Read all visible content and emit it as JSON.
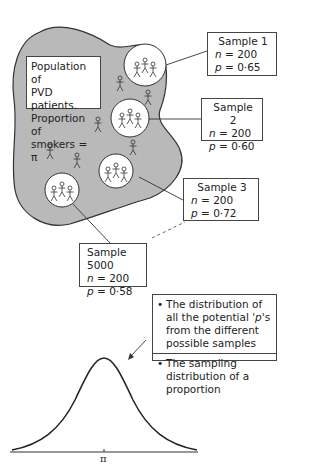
{
  "population": {
    "lines": [
      "Population of",
      "PVD patients.",
      "Proportion of",
      "smokers = π"
    ]
  },
  "samples": [
    {
      "title": "Sample 1",
      "n_label": "n",
      "n_value": " = 200",
      "p_label": "p",
      "p_value": " = 0·65"
    },
    {
      "title": "Sample 2",
      "n_label": "n",
      "n_value": " = 200",
      "p_label": "p",
      "p_value": " = 0·60"
    },
    {
      "title": "Sample 3",
      "n_label": "n",
      "n_value": " = 200",
      "p_label": "p",
      "p_value": " = 0·72"
    },
    {
      "title": "Sample 5000",
      "n_label": "n",
      "n_value": " = 200",
      "p_label": "p",
      "p_value": " = 0·58"
    }
  ],
  "distribution_notes": [
    {
      "bullet": "•",
      "text_before": "The distribution of all the potential '",
      "italic": "p",
      "text_after": "'s from the different possible samples"
    },
    {
      "bullet": "•",
      "text_before": "The sampling distribution of a proportion",
      "italic": "",
      "text_after": ""
    }
  ],
  "curve": {
    "axis_label": "π",
    "type": "normal-bell-curve"
  },
  "colors": {
    "population_fill": "#b9b9b9",
    "outline": "#333333",
    "box_border": "#444444"
  }
}
